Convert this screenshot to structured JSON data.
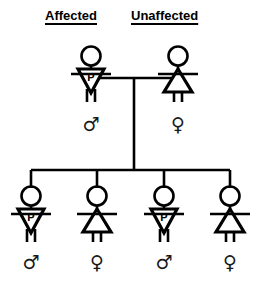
{
  "figure": {
    "width": 269,
    "height": 286,
    "background_color": "#ffffff",
    "stroke_color": "#000000",
    "symbol_color": "#1a1a1a"
  },
  "headers": {
    "left": "Affected",
    "right": "Unaffected"
  },
  "affected_marker": {
    "label": "P",
    "meaning_shape": "inverted-triangle-male"
  },
  "generations": {
    "parents": {
      "father": {
        "role": "father",
        "status": "affected",
        "sex": "male",
        "sex_symbol": "♂",
        "body_label": "P",
        "x": 91,
        "head_y": 55,
        "symbol_x": 91,
        "symbol_y": 124
      },
      "mother": {
        "role": "mother",
        "status": "unaffected",
        "sex": "female",
        "sex_symbol": "♀",
        "body_label": "",
        "x": 178,
        "head_y": 55,
        "symbol_x": 178,
        "symbol_y": 124
      },
      "mating_line_y": 78,
      "descent_line_x": 134
    },
    "children": [
      {
        "index": 1,
        "status": "affected",
        "sex": "male",
        "sex_symbol": "♂",
        "body_label": "P",
        "x": 31,
        "head_y": 195,
        "symbol_x": 31,
        "symbol_y": 262
      },
      {
        "index": 2,
        "status": "unaffected",
        "sex": "female",
        "sex_symbol": "♀",
        "body_label": "",
        "x": 97,
        "head_y": 195,
        "symbol_x": 97,
        "symbol_y": 262
      },
      {
        "index": 3,
        "status": "affected",
        "sex": "male",
        "sex_symbol": "♂",
        "body_label": "P",
        "x": 164,
        "head_y": 195,
        "symbol_x": 164,
        "symbol_y": 262
      },
      {
        "index": 4,
        "status": "unaffected",
        "sex": "female",
        "sex_symbol": "♀",
        "body_label": "",
        "x": 230,
        "head_y": 195,
        "symbol_x": 230,
        "symbol_y": 262
      }
    ],
    "sibship_line_y": 170,
    "sibship_line_x1": 31,
    "sibship_line_x2": 230
  }
}
